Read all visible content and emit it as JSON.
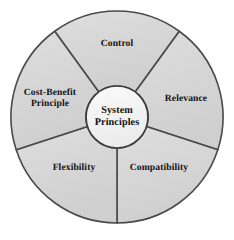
{
  "diagram": {
    "type": "segmented-wheel",
    "title": "System Principles",
    "segment_count": 5,
    "colors": {
      "background": "#ffffff",
      "sector_fill": "#d5d5d5",
      "sector_fill_light": "#dedede",
      "hub_fill": "#f4f4f4",
      "outline": "#4a4a4a",
      "hub_outline": "#3c3c3c",
      "text": "#111111"
    },
    "hub": {
      "label": "System\nPrinciples",
      "center_x": 117,
      "center_y": 117,
      "radius": 31
    },
    "outer": {
      "center_x": 117,
      "center_y": 117,
      "radius": 106
    },
    "segments": [
      {
        "id": "control",
        "label": "Control",
        "start_angle": -36,
        "end_angle": 36,
        "label_x": 117,
        "label_y": 44
      },
      {
        "id": "relevance",
        "label": "Relevance",
        "start_angle": 36,
        "end_angle": 108,
        "label_x": 186,
        "label_y": 99
      },
      {
        "id": "compatibility",
        "label": "Compatibility",
        "label_x": 159,
        "label_y": 168,
        "start_angle": 108,
        "end_angle": 180
      },
      {
        "id": "flexibility",
        "label": "Flexibility",
        "label_x": 74,
        "label_y": 168,
        "start_angle": 180,
        "end_angle": 252
      },
      {
        "id": "cost-benefit-principle",
        "label": "Cost-Benefit\nPrinciple",
        "label_x": 50,
        "label_y": 99,
        "start_angle": 252,
        "end_angle": 324
      }
    ]
  }
}
